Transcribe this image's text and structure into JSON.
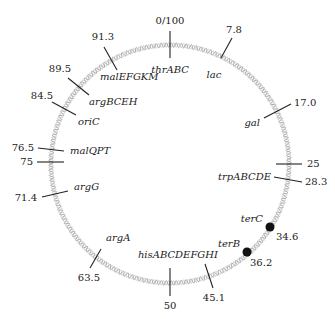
{
  "diagram": {
    "title": "",
    "type": "circular-chromosome-map",
    "total_length": 100,
    "origin_label": "0/100",
    "colors": {
      "ink": "#222222",
      "helix_dark": "#a8a8a8",
      "helix_light": "#cfcfcf",
      "background": "#ffffff"
    },
    "markers": [
      {
        "id": "thrABC",
        "position": 0,
        "position_label": "0/100",
        "gene": "thrABC"
      },
      {
        "id": "lac",
        "position": 7.8,
        "position_label": "7.8",
        "gene": "lac"
      },
      {
        "id": "gal",
        "position": 17.0,
        "position_label": "17.0",
        "gene": "gal"
      },
      {
        "id": "m25",
        "position": 25,
        "position_label": "25",
        "gene": ""
      },
      {
        "id": "trpABCDE",
        "position": 28.3,
        "position_label": "28.3",
        "gene": "trpABCDE"
      },
      {
        "id": "terC",
        "position": 34.6,
        "position_label": "34.6",
        "gene": "terC",
        "style": "dot"
      },
      {
        "id": "terB",
        "position": 36.2,
        "position_label": "36.2",
        "gene": "terB",
        "style": "dot"
      },
      {
        "id": "hisABCDEFGHI",
        "position": 45.1,
        "position_label": "45.1",
        "gene": "hisABCDEFGHI"
      },
      {
        "id": "m50",
        "position": 50,
        "position_label": "50",
        "gene": ""
      },
      {
        "id": "argA",
        "position": 63.5,
        "position_label": "63.5",
        "gene": "argA"
      },
      {
        "id": "argG",
        "position": 71.4,
        "position_label": "71.4",
        "gene": "argG"
      },
      {
        "id": "m75",
        "position": 75,
        "position_label": "75",
        "gene": ""
      },
      {
        "id": "malQPT",
        "position": 76.5,
        "position_label": "76.5",
        "gene": "malQPT"
      },
      {
        "id": "oriC",
        "position": 84.5,
        "position_label": "84.5",
        "gene": "oriC"
      },
      {
        "id": "argBCEH",
        "position": 89.5,
        "position_label": "89.5",
        "gene": "argBCEH"
      },
      {
        "id": "malEFGKM",
        "position": 91.3,
        "position_label": "91.3",
        "gene": "malEFGKM"
      }
    ]
  },
  "labels": {
    "origin": "0/100",
    "thrABC": "thrABC",
    "lac_pos": "7.8",
    "lac": "lac",
    "gal_pos": "17.0",
    "gal": "gal",
    "p25": "25",
    "trp_pos": "28.3",
    "trp": "trpABCDE",
    "terC": "terC",
    "terC_pos": "34.6",
    "terB": "terB",
    "terB_pos": "36.2",
    "his": "hisABCDEFGHI",
    "his_pos": "45.1",
    "p50": "50",
    "argA": "argA",
    "argA_pos": "63.5",
    "argG": "argG",
    "argG_pos": "71.4",
    "p75": "75",
    "malQPT": "malQPT",
    "malQPT_pos": "76.5",
    "oriC": "oriC",
    "oriC_pos": "84.5",
    "argBCEH": "argBCEH",
    "argBCEH_pos": "89.5",
    "malEFGKM": "malEFGKM",
    "malEFGKM_pos": "91.3"
  }
}
